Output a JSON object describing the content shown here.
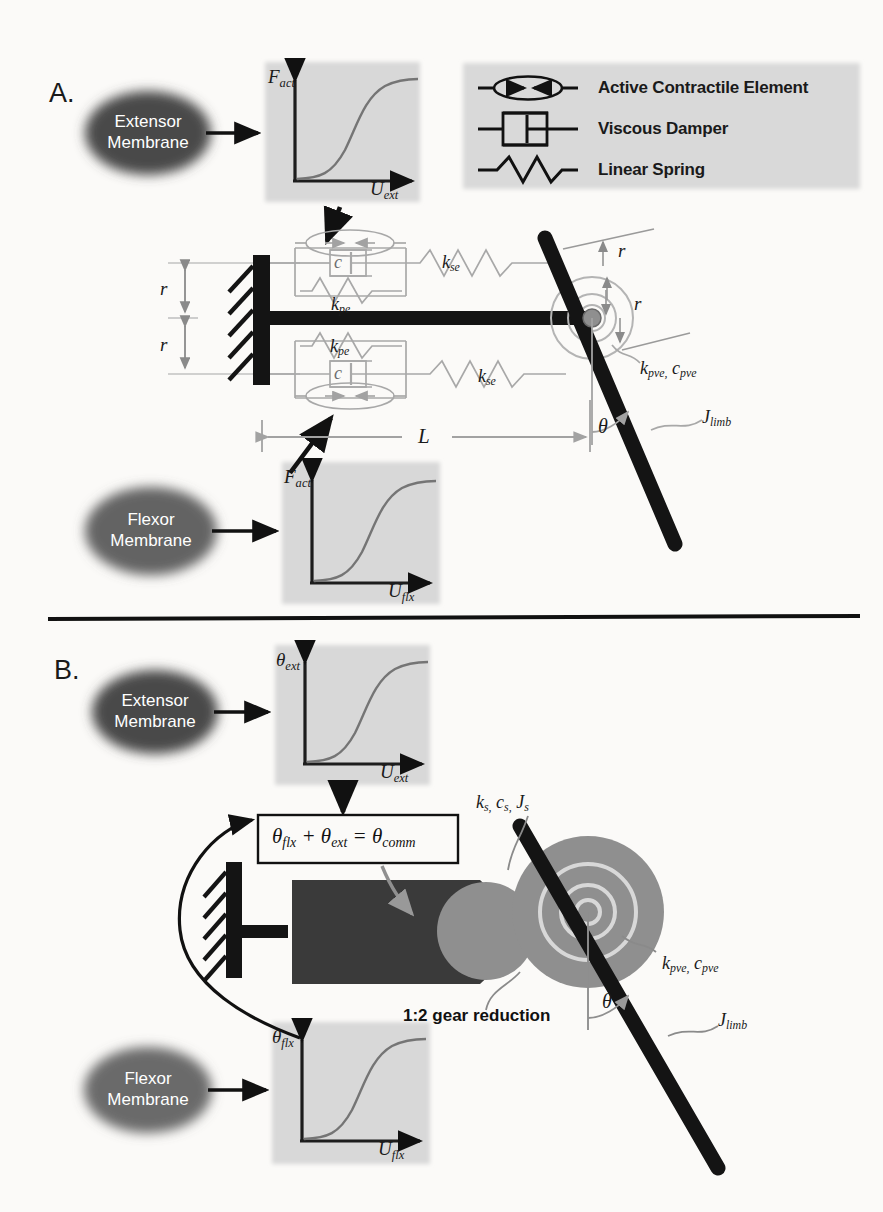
{
  "figure": {
    "panels": [
      {
        "id": "A",
        "label": "A."
      },
      {
        "id": "B",
        "label": "B."
      }
    ],
    "legend": {
      "items": [
        {
          "icon": "active-contractile-element-icon",
          "label": "Active Contractile Element"
        },
        {
          "icon": "viscous-damper-icon",
          "label": "Viscous Damper"
        },
        {
          "icon": "linear-spring-icon",
          "label": "Linear Spring"
        }
      ]
    },
    "panelA": {
      "bubbles": [
        {
          "name": "extensor-membrane-bubble",
          "line1": "Extensor",
          "line2": "Membrane"
        },
        {
          "name": "flexor-membrane-bubble",
          "line1": "Flexor",
          "line2": "Membrane"
        }
      ],
      "plots": [
        {
          "name": "extensor-force-plot",
          "ylabel": "F",
          "ysub": "act",
          "xlabel": "U",
          "xsub": "ext",
          "curve": "sigmoid"
        },
        {
          "name": "flexor-force-plot",
          "ylabel": "F",
          "ysub": "act",
          "xlabel": "U",
          "xsub": "flx",
          "curve": "sigmoid"
        }
      ],
      "labels": {
        "moment_arm_top": "r",
        "moment_arm_bottom": "r",
        "joint_radius_top": "r",
        "joint_radius_bottom": "r",
        "muscle_length": "L",
        "joint_angle": "θ",
        "parallel_elastic_top": {
          "sym": "k",
          "sub": "pe"
        },
        "parallel_elastic_bottom": {
          "sym": "k",
          "sub": "pe"
        },
        "series_elastic_top": {
          "sym": "k",
          "sub": "se"
        },
        "series_elastic_bottom": {
          "sym": "k",
          "sub": "se"
        },
        "damper_top": "c",
        "damper_bottom": "c",
        "passive_viscoelastic": {
          "sym1": "k",
          "sub1": "pve,",
          "sym2": "c",
          "sub2": "pve"
        },
        "limb_inertia": {
          "sym": "J",
          "sub": "limb"
        }
      }
    },
    "panelB": {
      "bubbles": [
        {
          "name": "extensor-membrane-bubble",
          "line1": "Extensor",
          "line2": "Membrane"
        },
        {
          "name": "flexor-membrane-bubble",
          "line1": "Flexor",
          "line2": "Membrane"
        }
      ],
      "plots": [
        {
          "name": "extensor-angle-plot",
          "ylabel": "θ",
          "ysub": "ext",
          "xlabel": "U",
          "xsub": "ext",
          "curve": "sigmoid"
        },
        {
          "name": "flexor-angle-plot",
          "ylabel": "θ",
          "ysub": "flx",
          "xlabel": "U",
          "xsub": "flx",
          "curve": "sigmoid"
        }
      ],
      "equation": "θflx + θext = θcomm",
      "equation_parts": {
        "term1_sym": "θ",
        "term1_sub": "flx",
        "operator": "+",
        "term2_sym": "θ",
        "term2_sub": "ext",
        "equals": "=",
        "result_sym": "θ",
        "result_sub": "comm"
      },
      "labels": {
        "servo_params": {
          "sym1": "k",
          "sub1": "s,",
          "sym2": "c",
          "sub2": "s,",
          "sym3": "J",
          "sub3": "s"
        },
        "gear_reduction": "1:2 gear reduction",
        "joint_angle": "θ",
        "passive_viscoelastic": {
          "sym1": "k",
          "sub1": "pve,",
          "sym2": "c",
          "sub2": "pve"
        },
        "limb_inertia": {
          "sym": "J",
          "sub": "limb"
        }
      }
    },
    "colors": {
      "background": "#fbfaf8",
      "bubble_fill": "#4a4a4a",
      "bubble_text": "#ffffff",
      "plot_panel": "#d8d8d8",
      "legend_panel": "#d9d9d9",
      "dark_structure": "#1a1a1a",
      "servo_body": "#3a3a3a",
      "gear_gray": "#8f8f8f",
      "faint_line": "#b9b9b9",
      "curve_line": "#6a6a6a",
      "divider": "#111111"
    }
  }
}
